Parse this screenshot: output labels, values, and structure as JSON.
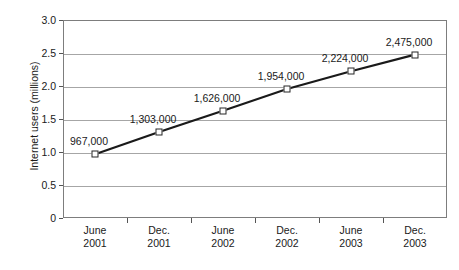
{
  "chart_data": {
    "type": "line",
    "title": "",
    "subtitle": "",
    "xlabel": "",
    "ylabel": "Internet users (millions)",
    "categories": [
      "June 2001",
      "Dec. 2001",
      "June 2002",
      "Dec. 2002",
      "June 2003",
      "Dec. 2003"
    ],
    "category_lines": [
      [
        "June",
        "2001"
      ],
      [
        "Dec.",
        "2001"
      ],
      [
        "June",
        "2002"
      ],
      [
        "Dec.",
        "2002"
      ],
      [
        "June",
        "2003"
      ],
      [
        "Dec.",
        "2003"
      ]
    ],
    "values": [
      0.967,
      1.303,
      1.626,
      1.954,
      2.224,
      2.475
    ],
    "point_labels": [
      "967,000",
      "1,303,000",
      "1,626,000",
      "1,954,000",
      "2,224,000",
      "2,475,000"
    ],
    "ylim": [
      0,
      3.0
    ],
    "yticks": [
      0,
      0.5,
      1.0,
      1.5,
      2.0,
      2.5,
      3.0
    ],
    "ytick_labels": [
      "0",
      "0.5",
      "1.0",
      "1.5",
      "2.0",
      "2.5",
      "3.0"
    ],
    "grid": true,
    "grid_axis": "y",
    "legend": false,
    "series": [
      {
        "name": "Internet users",
        "values": [
          0.967,
          1.303,
          1.626,
          1.954,
          2.224,
          2.475
        ],
        "line_color": "#1a1a1a",
        "marker": "square",
        "marker_fill": "#ffffff",
        "marker_edge": "#262626"
      }
    ],
    "colors": {
      "line": "#1a1a1a",
      "gridline": "#a6a6a6",
      "axis": "#7d7d7d",
      "text": "#1a1a1a",
      "background": "#ffffff"
    }
  }
}
